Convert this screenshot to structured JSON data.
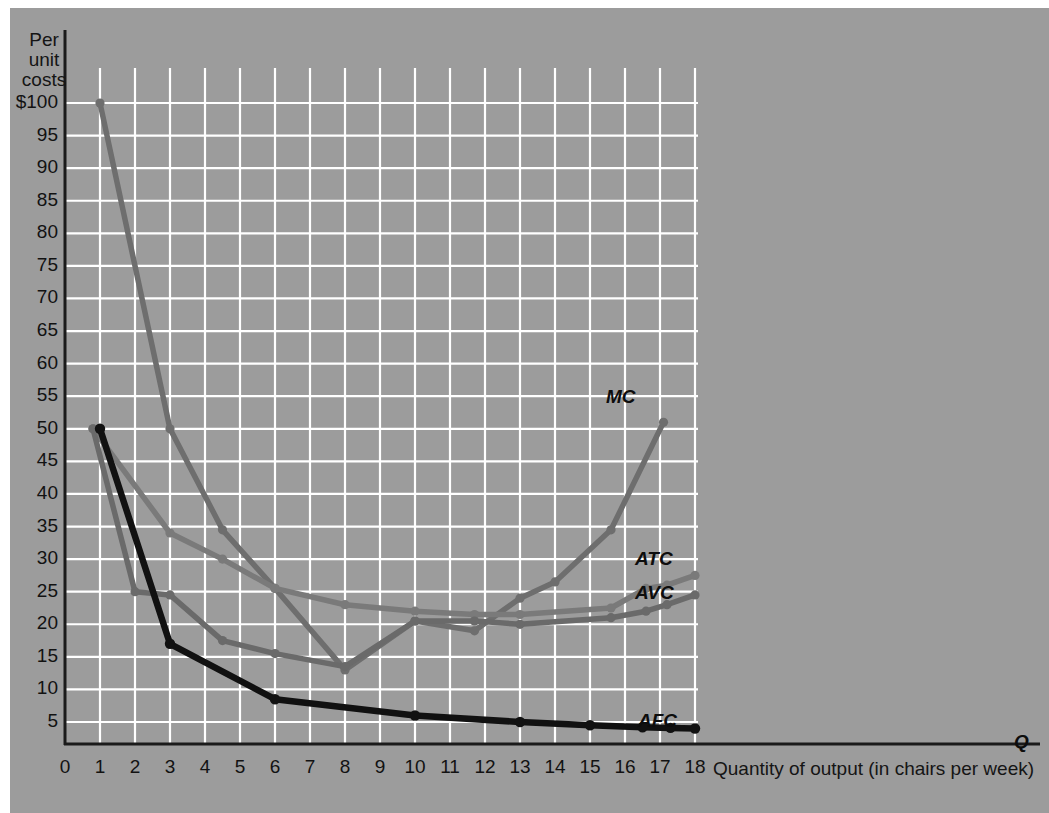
{
  "figure": {
    "background_color": "#9c9c9c",
    "grid_color": "#ffffff",
    "axis_color": "#1a1a1a"
  },
  "axes": {
    "y_title_lines": [
      "Per",
      "unit",
      "costs"
    ],
    "y_ticks": [
      "$100",
      "95",
      "90",
      "85",
      "80",
      "75",
      "70",
      "65",
      "60",
      "55",
      "50",
      "45",
      "40",
      "35",
      "30",
      "25",
      "20",
      "15",
      "10",
      "5"
    ],
    "y_tick_values": [
      100,
      95,
      90,
      85,
      80,
      75,
      70,
      65,
      60,
      55,
      50,
      45,
      40,
      35,
      30,
      25,
      20,
      15,
      10,
      5
    ],
    "x_ticks": [
      "0",
      "1",
      "2",
      "3",
      "4",
      "5",
      "6",
      "7",
      "8",
      "9",
      "10",
      "11",
      "12",
      "13",
      "14",
      "15",
      "16",
      "17",
      "18"
    ],
    "x_title": "Quantity of output (in chairs per week)",
    "x_axis_marker": "Q"
  },
  "curve_labels": {
    "mc": "MC",
    "atc": "ATC",
    "avc": "AVC",
    "afc": "AFC"
  },
  "chart_data": {
    "type": "line",
    "title": "",
    "xlabel": "Quantity of output (in chairs per week)",
    "ylabel": "Per unit costs",
    "xlim": [
      0,
      18.6
    ],
    "ylim": [
      0,
      103
    ],
    "grid": true,
    "legend": "inline-right",
    "colors": {
      "MC": "#6e6e6e",
      "ATC": "#7a7a7a",
      "AVC": "#6a6a6a",
      "AFC": "#111111"
    },
    "series": [
      {
        "name": "MC",
        "label": "MC",
        "color": "#6e6e6e",
        "points": [
          [
            1,
            100
          ],
          [
            3,
            50
          ],
          [
            4.5,
            34.5
          ],
          [
            6,
            25.5
          ],
          [
            8,
            13
          ],
          [
            10,
            20.5
          ],
          [
            11.7,
            19
          ],
          [
            13,
            24
          ],
          [
            14,
            26.5
          ],
          [
            15.6,
            34.5
          ],
          [
            17.1,
            51
          ]
        ]
      },
      {
        "name": "ATC",
        "label": "ATC",
        "color": "#7a7a7a",
        "points": [
          [
            0.8,
            50
          ],
          [
            3,
            34
          ],
          [
            4.5,
            30
          ],
          [
            6,
            25.5
          ],
          [
            8,
            23
          ],
          [
            10,
            22
          ],
          [
            11.7,
            21.5
          ],
          [
            13,
            21.5
          ],
          [
            15.6,
            22.5
          ],
          [
            16.6,
            25.5
          ],
          [
            17.2,
            26
          ],
          [
            18,
            27.5
          ]
        ]
      },
      {
        "name": "AVC",
        "label": "AVC",
        "color": "#6a6a6a",
        "points": [
          [
            0.8,
            50
          ],
          [
            2,
            25
          ],
          [
            3,
            24.5
          ],
          [
            4.5,
            17.5
          ],
          [
            6,
            15.5
          ],
          [
            8,
            13.5
          ],
          [
            10,
            20.5
          ],
          [
            11.7,
            20.5
          ],
          [
            13,
            20
          ],
          [
            15.6,
            21
          ],
          [
            16.6,
            22
          ],
          [
            17.2,
            23
          ],
          [
            18,
            24.5
          ]
        ]
      },
      {
        "name": "AFC",
        "label": "AFC",
        "color": "#111111",
        "points": [
          [
            1,
            50
          ],
          [
            3,
            17
          ],
          [
            6,
            8.5
          ],
          [
            10,
            6
          ],
          [
            13,
            5
          ],
          [
            15,
            4.5
          ],
          [
            16.5,
            4.2
          ],
          [
            17.3,
            4.1
          ],
          [
            18,
            4
          ]
        ]
      }
    ]
  }
}
